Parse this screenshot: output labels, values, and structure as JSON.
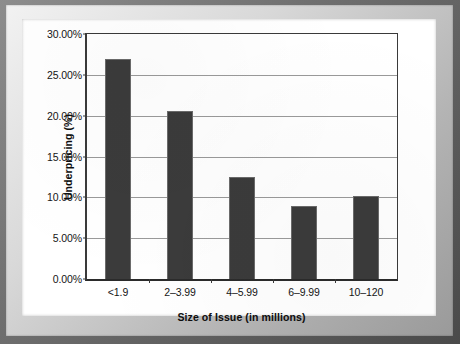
{
  "chart_data": {
    "type": "bar",
    "title": "",
    "subtitle": "",
    "xlabel": "Size of Issue (in millions)",
    "ylabel": "Underpricing (%)",
    "categories": [
      "<1.9",
      "2–3.99",
      "4–5.99",
      "6–9.99",
      "10–120"
    ],
    "values": [
      26.9,
      20.6,
      12.5,
      8.9,
      10.2
    ],
    "value_labels": [
      "26.90%",
      "20.60%",
      "12.50%",
      "8.90%",
      "10.20%"
    ],
    "ylim": [
      0,
      30
    ],
    "ytick_values": [
      0,
      5,
      10,
      15,
      20,
      25,
      30
    ],
    "ytick_labels": [
      "0.00%",
      "5.00%",
      "10.00%",
      "15.00%",
      "20.00%",
      "25.00%",
      "30.00%"
    ],
    "grid": true,
    "grid_axis": "y",
    "legend": false,
    "legend_position": "none",
    "bar_color": "#3b3b3b",
    "bar_edge_color": "#6b6b6b",
    "gridline_color": "#9a9a9a",
    "axis_color": "#3a3a3a",
    "plot_background": "#ffffff",
    "annotations": []
  },
  "frame": {
    "border_color": "#6f6f6f",
    "bevel_color": "#d8d8d8",
    "page_color": "#ffffff"
  }
}
